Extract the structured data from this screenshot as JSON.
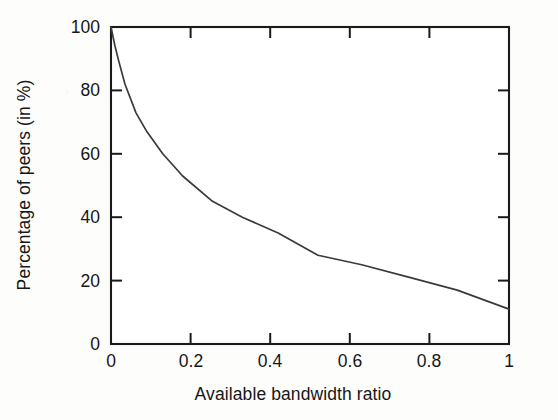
{
  "chart_data": {
    "type": "line",
    "title": "",
    "subtitle": "",
    "xlabel": "Available bandwidth ratio",
    "ylabel": "Percentage of peers (in %)",
    "xlim": [
      0,
      1
    ],
    "ylim": [
      0,
      100
    ],
    "xticks": [
      0,
      0.2,
      0.4,
      0.6,
      0.8,
      1
    ],
    "xtick_labels": [
      "0",
      "0.2",
      "0.4",
      "0.6",
      "0.8",
      "1"
    ],
    "yticks": [
      0,
      20,
      40,
      60,
      80,
      100
    ],
    "ytick_labels": [
      "0",
      "20",
      "40",
      "60",
      "80",
      "100"
    ],
    "grid": false,
    "legend": null,
    "legend_position": "none",
    "line_color": "#3a3a3a",
    "frame_color": "#1a1a1a",
    "background_color": "#ffffff",
    "series": [
      {
        "name": "Percentage of peers",
        "x": [
          0,
          0.01,
          0.02,
          0.035,
          0.0625,
          0.09,
          0.13,
          0.18,
          0.255,
          0.33,
          0.42,
          0.52,
          0.63,
          0.75,
          0.87,
          1
        ],
        "values": [
          100,
          94,
          89,
          82,
          73,
          67,
          60,
          53,
          45,
          40,
          35,
          28,
          25,
          21,
          17,
          11
        ]
      }
    ],
    "annotations": []
  },
  "axes": {
    "x_title": "Available bandwidth ratio",
    "y_title": "Percentage of peers (in %)"
  }
}
